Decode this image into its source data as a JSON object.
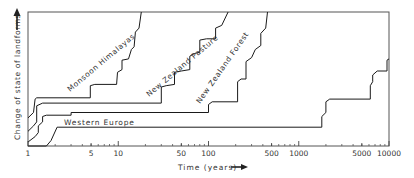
{
  "chart_data": {
    "type": "line",
    "title": "",
    "xlabel": "Time (years)",
    "ylabel": "Change of state of landforms",
    "xscale": "log",
    "xlim": [
      1,
      10000
    ],
    "ylim": [
      0,
      100
    ],
    "grid": false,
    "legend": "inline labels",
    "x_ticks": [
      {
        "value": 1,
        "label": "1"
      },
      {
        "value": 5,
        "label": "5"
      },
      {
        "value": 10,
        "label": "10"
      },
      {
        "value": 50,
        "label": "50"
      },
      {
        "value": 100,
        "label": "100"
      },
      {
        "value": 500,
        "label": "500"
      },
      {
        "value": 1000,
        "label": "1000"
      },
      {
        "value": 5000,
        "label": "5000"
      },
      {
        "value": 10000,
        "label": "10000"
      }
    ],
    "series": [
      {
        "name": "Monsoon Himalayas",
        "points": [
          [
            1,
            21
          ],
          [
            1.15,
            25
          ],
          [
            1.2,
            35
          ],
          [
            1.25,
            36
          ],
          [
            4.9,
            36
          ],
          [
            4.9,
            45
          ],
          [
            5.5,
            46
          ],
          [
            9.6,
            46
          ],
          [
            9.8,
            55
          ],
          [
            11,
            57
          ],
          [
            11,
            64
          ],
          [
            13,
            65
          ],
          [
            14,
            72
          ],
          [
            15,
            74
          ],
          [
            15.5,
            85
          ],
          [
            17,
            88
          ],
          [
            18,
            100
          ]
        ]
      },
      {
        "name": "New Zealand Pasture",
        "points": [
          [
            1,
            11
          ],
          [
            1.15,
            15
          ],
          [
            1.25,
            18
          ],
          [
            1.25,
            30
          ],
          [
            1.45,
            32
          ],
          [
            30,
            32
          ],
          [
            30,
            44
          ],
          [
            34,
            45
          ],
          [
            42,
            46
          ],
          [
            42,
            55
          ],
          [
            50,
            56
          ],
          [
            62,
            57
          ],
          [
            62,
            67
          ],
          [
            70,
            69
          ],
          [
            80,
            70
          ],
          [
            80,
            79
          ],
          [
            95,
            80
          ],
          [
            120,
            80
          ],
          [
            120,
            88
          ],
          [
            140,
            90
          ],
          [
            165,
            100
          ]
        ]
      },
      {
        "name": "New Zealand Forest",
        "points": [
          [
            1,
            3
          ],
          [
            1.2,
            7
          ],
          [
            1.3,
            10
          ],
          [
            1.3,
            15
          ],
          [
            1.45,
            18
          ],
          [
            1.45,
            22
          ],
          [
            1.6,
            23
          ],
          [
            3,
            23
          ],
          [
            3,
            25
          ],
          [
            100,
            25
          ],
          [
            100,
            31
          ],
          [
            110,
            33
          ],
          [
            210,
            33
          ],
          [
            210,
            48
          ],
          [
            230,
            50
          ],
          [
            260,
            50
          ],
          [
            260,
            63
          ],
          [
            300,
            66
          ],
          [
            330,
            72
          ],
          [
            380,
            75
          ],
          [
            380,
            84
          ],
          [
            430,
            88
          ],
          [
            450,
            100
          ]
        ]
      },
      {
        "name": "Western Europe",
        "points": [
          [
            1,
            0
          ],
          [
            1.6,
            0
          ],
          [
            1.8,
            4
          ],
          [
            2.1,
            14
          ],
          [
            2.2,
            14
          ],
          [
            1800,
            14
          ],
          [
            1800,
            22
          ],
          [
            2000,
            25
          ],
          [
            2000,
            33
          ],
          [
            2200,
            35
          ],
          [
            6200,
            35
          ],
          [
            6200,
            45
          ],
          [
            6600,
            48
          ],
          [
            6600,
            53
          ],
          [
            7400,
            56
          ],
          [
            9500,
            56
          ],
          [
            9500,
            64
          ],
          [
            10000,
            65
          ]
        ]
      }
    ],
    "annotations": [
      {
        "text": "Monsoon Himalayas",
        "color": "#000000"
      },
      {
        "text": "New Zealand Pasture",
        "color": "#000000"
      },
      {
        "text": "New Zealand Forest",
        "color": "#000000"
      },
      {
        "text": "Western Europe",
        "color": "#000000"
      }
    ]
  },
  "labels": {
    "ylabel": "Change of state of landforms",
    "xlabel": "Time (years)",
    "series_himalayas": "Monsoon Himalayas",
    "series_nz_pasture": "New Zealand Pasture",
    "series_nz_forest": "New Zealand Forest",
    "series_western_europe": "Western Europe"
  },
  "style": {
    "line_color": "#1a1a1a",
    "frame_color": "#444444",
    "text_color": "#333333"
  }
}
